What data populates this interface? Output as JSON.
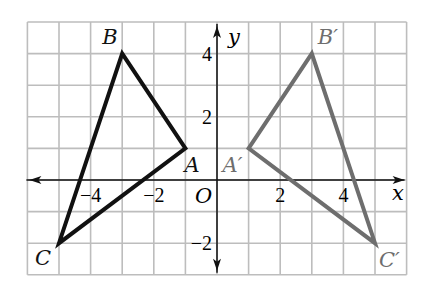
{
  "figure": {
    "type": "coordinate-plane-reflection",
    "grid": {
      "x_min": -6,
      "x_max": 6,
      "y_min": -3,
      "y_max": 5,
      "step": 1,
      "color": "#bdbdbd"
    },
    "axes": {
      "x_label": "x",
      "y_label": "y",
      "origin_label": "O",
      "color": "#111111"
    },
    "tick_labels": {
      "x": [
        {
          "value": -4,
          "text": "−4"
        },
        {
          "value": -2,
          "text": "−2"
        },
        {
          "value": 2,
          "text": "2"
        },
        {
          "value": 4,
          "text": "4"
        }
      ],
      "y": [
        {
          "value": 4,
          "text": "4"
        },
        {
          "value": 2,
          "text": "2"
        },
        {
          "value": -2,
          "text": "−2"
        }
      ]
    },
    "triangles": [
      {
        "name": "ABC",
        "color": "#111111",
        "vertices": [
          {
            "label": "A",
            "x": -1,
            "y": 1
          },
          {
            "label": "B",
            "x": -3,
            "y": 4
          },
          {
            "label": "C",
            "x": -5,
            "y": -2
          }
        ]
      },
      {
        "name": "A'B'C'",
        "color": "#6e6e6e",
        "vertices": [
          {
            "label": "A′",
            "x": 1,
            "y": 1
          },
          {
            "label": "B′",
            "x": 3,
            "y": 4
          },
          {
            "label": "C′",
            "x": 5,
            "y": -2
          }
        ]
      }
    ]
  }
}
